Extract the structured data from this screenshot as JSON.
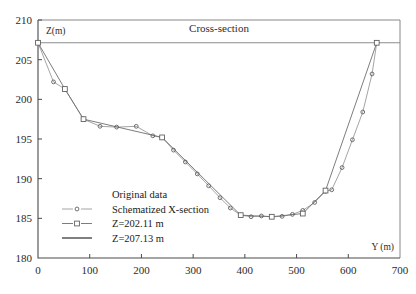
{
  "chart_data": {
    "type": "line",
    "title": "Cross-section",
    "xlabel": "Y (m)",
    "ylabel": "Z(m)",
    "xlim": [
      0,
      700
    ],
    "ylim": [
      180,
      210
    ],
    "xticks": [
      0,
      100,
      200,
      300,
      400,
      500,
      600,
      700
    ],
    "yticks": [
      180,
      185,
      190,
      195,
      200,
      205,
      210
    ],
    "grid": false,
    "legend_position": "lower-left-inside",
    "reference_lines": [
      {
        "name": "Z=207.13 m",
        "value": 207.13,
        "orientation": "horizontal"
      }
    ],
    "series": [
      {
        "name": "Original data",
        "marker": "circle",
        "x": [
          0,
          30,
          52,
          88,
          120,
          152,
          190,
          222,
          240,
          262,
          285,
          308,
          330,
          352,
          372,
          392,
          412,
          432,
          452,
          472,
          492,
          512,
          535,
          556,
          568,
          588,
          608,
          628,
          646,
          655
        ],
        "y": [
          207.13,
          202.2,
          201.3,
          197.5,
          196.6,
          196.5,
          196.6,
          195.4,
          195.2,
          193.6,
          192.1,
          190.6,
          189.1,
          187.6,
          186.3,
          185.4,
          185.2,
          185.3,
          185.2,
          185.25,
          185.5,
          186.0,
          187.0,
          188.4,
          188.6,
          191.4,
          194.9,
          198.4,
          203.2,
          207.13
        ]
      },
      {
        "name": "Schematized X-section",
        "marker": "square",
        "x": [
          0,
          52,
          88,
          240,
          392,
          452,
          512,
          556,
          655
        ],
        "y": [
          207.13,
          201.3,
          197.5,
          195.2,
          185.4,
          185.2,
          185.6,
          188.5,
          207.13
        ]
      }
    ],
    "legend": [
      {
        "label": "Original data",
        "marker": "none"
      },
      {
        "label": "Schematized X-section",
        "marker": "circle-line"
      },
      {
        "label": "Z=202.11 m",
        "marker": "square-line"
      },
      {
        "label": "Z=207.13 m",
        "marker": "solid-line"
      }
    ]
  },
  "colors": {
    "axis": "#4a4a4a",
    "original_series": "#9a9a9a",
    "schematized_series": "#6e6e6e",
    "reference_line": "#8c8c8c"
  }
}
